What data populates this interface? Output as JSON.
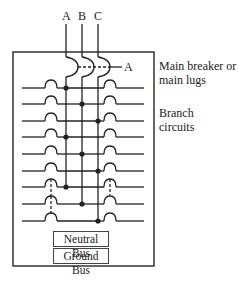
{
  "diagram": {
    "phases": [
      {
        "label": "A",
        "x": 66
      },
      {
        "label": "B",
        "x": 82
      },
      {
        "label": "C",
        "x": 98
      }
    ],
    "main_breaker_callout": "A",
    "labels": {
      "main": "Main breaker or main lugs",
      "main_line1": "Main breaker or",
      "main_line2": "main lugs",
      "branch_line1": "Branch",
      "branch_line2": "circuits"
    },
    "buses": {
      "neutral": "Neutral Bus",
      "ground": "Ground Bus"
    },
    "branch_rows": [
      {
        "y": 88,
        "phase": "A",
        "left_tie": false,
        "right_tie": false
      },
      {
        "y": 104,
        "phase": "B",
        "left_tie": false,
        "right_tie": false
      },
      {
        "y": 121,
        "phase": "C",
        "left_tie": false,
        "right_tie": false
      },
      {
        "y": 137,
        "phase": "A",
        "left_tie": false,
        "right_tie": false
      },
      {
        "y": 154,
        "phase": "B",
        "left_tie": false,
        "right_tie": false
      },
      {
        "y": 171,
        "phase": "C",
        "left_tie": false,
        "right_tie": false
      },
      {
        "y": 187,
        "phase": "A",
        "left_tie": true,
        "right_tie": true
      },
      {
        "y": 204,
        "phase": "B",
        "left_tie": true,
        "right_tie": false
      },
      {
        "y": 221,
        "phase": "C",
        "left_tie": true,
        "right_tie": false
      }
    ],
    "colors": {
      "line": "#222222",
      "box": "#333333",
      "background": "#ffffff"
    }
  }
}
